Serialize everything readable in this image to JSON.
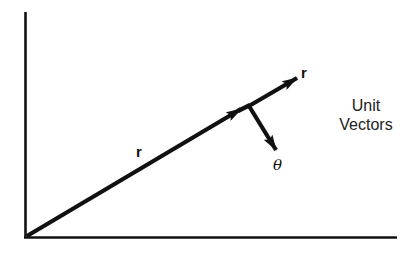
{
  "diagram": {
    "type": "vector-diagram",
    "labels": {
      "position_vector": "r",
      "unit_r": "r",
      "unit_theta": "θ",
      "caption_line1": "Unit",
      "caption_line2": "Vectors"
    },
    "colors": {
      "ink": "#111111",
      "background": "#ffffff"
    }
  }
}
